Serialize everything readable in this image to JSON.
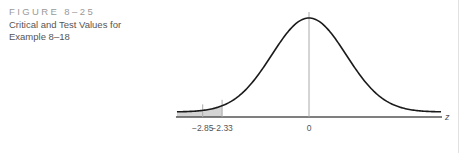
{
  "caption": {
    "figure_label": "FIGURE 8–25",
    "title": "Critical and Test Values for Example 8–18"
  },
  "chart_data": {
    "type": "area",
    "title": "Critical and Test Values for Example 8–18",
    "xlabel": "z",
    "ylabel": "",
    "xlim": [
      -3.54,
      3.54
    ],
    "grid": false,
    "legend": null,
    "distribution": {
      "name": "standard normal",
      "mean": 0,
      "sd": 1
    },
    "shaded_region": {
      "from": -3.54,
      "to": -2.33,
      "tail": "left"
    },
    "vertical_markers": [
      {
        "x": -2.85,
        "label": "−2.85",
        "meaning": "test value"
      },
      {
        "x": -2.33,
        "label": "−2.33",
        "meaning": "critical value"
      },
      {
        "x": 0,
        "label": "0",
        "meaning": "mean"
      }
    ],
    "tick_labels": [
      "−2.85",
      "−2.33",
      "0"
    ],
    "axis_label": "z"
  }
}
